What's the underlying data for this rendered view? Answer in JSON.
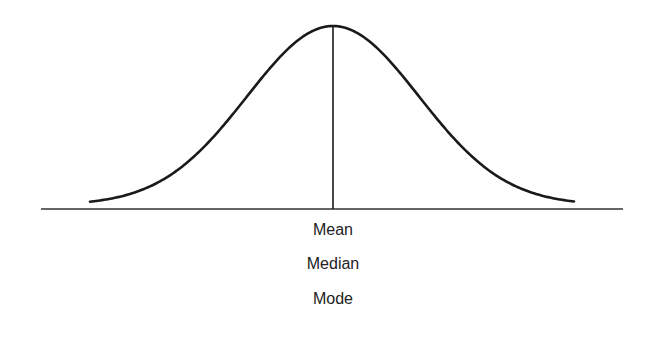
{
  "diagram": {
    "type": "normal-distribution",
    "labels": {
      "mean": "Mean",
      "median": "Median",
      "mode": "Mode"
    },
    "colors": {
      "curve": "#1a1a1a",
      "axis": "#333333",
      "center_line": "#1a1a1a",
      "text": "#222222"
    }
  }
}
